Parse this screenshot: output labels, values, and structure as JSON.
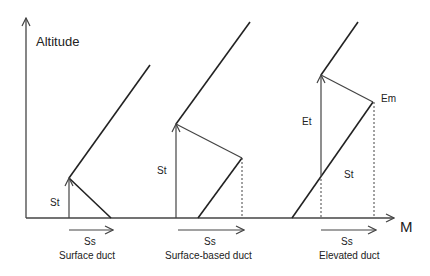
{
  "axes": {
    "y_label": "Altitude",
    "x_label": "M"
  },
  "panels": [
    {
      "caption": "Surface duct",
      "vertical_label": "St",
      "arrow_label": "Ss"
    },
    {
      "caption": "Surface-based duct",
      "vertical_label": "St",
      "arrow_label": "Ss"
    },
    {
      "caption": "Elevated duct",
      "upper_vertical_label": "Et",
      "lower_label": "St",
      "point_label": "Em",
      "arrow_label": "Ss"
    }
  ],
  "colors": {
    "line": "#222222",
    "thin": "#444444"
  }
}
